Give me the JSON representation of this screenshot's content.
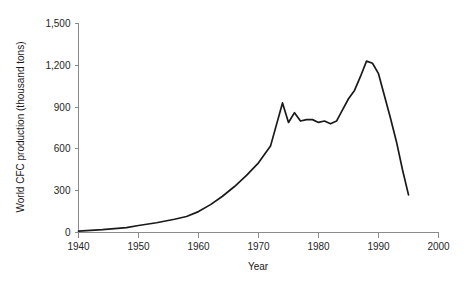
{
  "chart_data": {
    "type": "line",
    "title": "",
    "xlabel": "Year",
    "ylabel": "World CFC production (thousand tons)",
    "xlim": [
      1940,
      2000
    ],
    "ylim": [
      0,
      1500
    ],
    "grid": false,
    "legend": null,
    "xticks": [
      1940,
      1950,
      1960,
      1970,
      1980,
      1990,
      2000
    ],
    "xticklabels": [
      "1940",
      "1950",
      "1960",
      "1970",
      "1980",
      "1990",
      "2000"
    ],
    "yticks": [
      0,
      300,
      600,
      900,
      1200,
      1500
    ],
    "yticklabels": [
      "0",
      "300",
      "600",
      "900",
      "1,200",
      "1,500"
    ],
    "series": [
      {
        "name": "World CFC production",
        "color": "#1a1a1a",
        "x": [
          1940,
          1944,
          1948,
          1950,
          1953,
          1956,
          1958,
          1960,
          1962,
          1964,
          1966,
          1968,
          1970,
          1972,
          1974,
          1975,
          1976,
          1977,
          1978,
          1979,
          1980,
          1981,
          1982,
          1983,
          1984,
          1985,
          1986,
          1987,
          1988,
          1989,
          1990,
          1991,
          1992,
          1993,
          1994,
          1995
        ],
        "y": [
          10,
          20,
          35,
          50,
          70,
          95,
          115,
          150,
          200,
          260,
          330,
          410,
          500,
          620,
          930,
          790,
          860,
          800,
          810,
          810,
          790,
          800,
          780,
          800,
          880,
          960,
          1020,
          1120,
          1230,
          1215,
          1140,
          980,
          820,
          650,
          450,
          270
        ]
      }
    ]
  },
  "axis_label_color": "#262626",
  "axis_line_color": "#8a8a8a"
}
